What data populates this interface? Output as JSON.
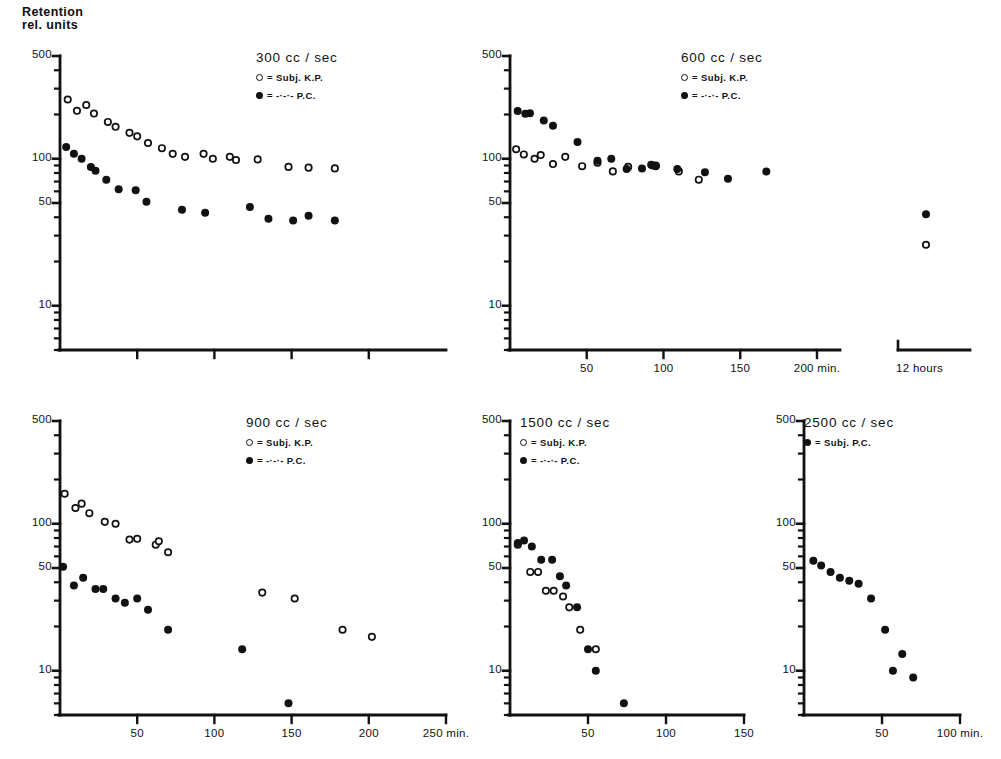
{
  "figure": {
    "y_axis_title_line1": "Retention",
    "y_axis_title_line2": "rel. units"
  },
  "chart_data": [
    {
      "id": "panel-300",
      "type": "scatter",
      "title": "300 cc / sec",
      "xlabel": "",
      "ylabel": "Retention rel. units",
      "yscale": "log",
      "ylim": [
        5,
        500
      ],
      "yticks": [
        500,
        100,
        50,
        10
      ],
      "ytick_labels": [
        "500",
        "100",
        "50",
        "10"
      ],
      "xlim": [
        0,
        250
      ],
      "xticks": [
        50,
        100,
        150,
        200
      ],
      "xtick_labels": [
        "",
        "",
        "",
        ""
      ],
      "grid": false,
      "legend_position": "top-right",
      "series": [
        {
          "name": "Subj. K.P.",
          "marker": "open-circle",
          "legend_text": "O = Subj. K.P.",
          "points": [
            [
              5,
              253
            ],
            [
              11,
              212
            ],
            [
              17,
              232
            ],
            [
              22,
              203
            ],
            [
              31,
              178
            ],
            [
              36,
              165
            ],
            [
              45,
              150
            ],
            [
              50,
              142
            ],
            [
              57,
              128
            ],
            [
              66,
              118
            ],
            [
              73,
              108
            ],
            [
              81,
              103
            ],
            [
              93,
              108
            ],
            [
              99,
              100
            ],
            [
              110,
              103
            ],
            [
              114,
              98
            ],
            [
              128,
              99
            ],
            [
              148,
              88
            ],
            [
              161,
              87
            ],
            [
              178,
              86
            ]
          ]
        },
        {
          "name": "P.C.",
          "marker": "filled-circle",
          "legend_text": "● = -·-·- P.C.",
          "points": [
            [
              4,
              120
            ],
            [
              9,
              108
            ],
            [
              14,
              100
            ],
            [
              20,
              88
            ],
            [
              23,
              83
            ],
            [
              30,
              72
            ],
            [
              38,
              62
            ],
            [
              49,
              61
            ],
            [
              56,
              51
            ],
            [
              79,
              45
            ],
            [
              94,
              43
            ],
            [
              123,
              47
            ],
            [
              135,
              39
            ],
            [
              151,
              38
            ],
            [
              161,
              41
            ],
            [
              178,
              38
            ]
          ]
        }
      ]
    },
    {
      "id": "panel-600",
      "type": "scatter",
      "title": "600 cc / sec",
      "xlabel": "min.",
      "ylabel": "",
      "yscale": "log",
      "ylim": [
        5,
        500
      ],
      "yticks": [
        500,
        100,
        50,
        10
      ],
      "ytick_labels": [
        "500",
        "100",
        "50",
        "10"
      ],
      "xlim": [
        0,
        215
      ],
      "xticks": [
        50,
        100,
        150,
        200
      ],
      "xtick_labels": [
        "50",
        "100",
        "150",
        "200 min."
      ],
      "break_axis_label": "12 hours",
      "grid": false,
      "legend_position": "top-right",
      "series": [
        {
          "name": "Subj. K.P.",
          "marker": "open-circle",
          "legend_text": "O = Subj. K.P.",
          "points": [
            [
              4,
              116
            ],
            [
              9,
              107
            ],
            [
              16,
              100
            ],
            [
              20,
              106
            ],
            [
              28,
              92
            ],
            [
              36,
              103
            ],
            [
              47,
              89
            ],
            [
              57,
              94
            ],
            [
              67,
              82
            ],
            [
              77,
              88
            ],
            [
              92,
              91
            ],
            [
              95,
              90
            ],
            [
              110,
              82
            ],
            [
              123,
              72
            ]
          ]
        },
        {
          "name": "P.C.",
          "marker": "filled-circle",
          "legend_text": "● = -·-·- P.C.",
          "points": [
            [
              5,
              211
            ],
            [
              10,
              202
            ],
            [
              13,
              204
            ],
            [
              22,
              182
            ],
            [
              28,
              168
            ],
            [
              44,
              130
            ],
            [
              57,
              97
            ],
            [
              66,
              100
            ],
            [
              76,
              85
            ],
            [
              86,
              86
            ],
            [
              93,
              90
            ],
            [
              95,
              89
            ],
            [
              109,
              85
            ],
            [
              127,
              81
            ],
            [
              142,
              73
            ],
            [
              167,
              82
            ]
          ]
        }
      ],
      "break_points": [
        {
          "series": "P.C.",
          "marker": "filled-circle",
          "value": 42
        },
        {
          "series": "Subj. K.P.",
          "marker": "open-circle",
          "value": 26
        }
      ]
    },
    {
      "id": "panel-900",
      "type": "scatter",
      "title": "900 cc / sec",
      "xlabel": "min.",
      "ylabel": "Retention rel. units",
      "yscale": "log",
      "ylim": [
        5,
        500
      ],
      "yticks": [
        500,
        100,
        50,
        10
      ],
      "ytick_labels": [
        "500",
        "100",
        "50",
        "10"
      ],
      "xlim": [
        0,
        250
      ],
      "xticks": [
        50,
        100,
        150,
        200,
        250
      ],
      "xtick_labels": [
        "50",
        "100",
        "150",
        "200",
        "250 min."
      ],
      "grid": false,
      "legend_position": "top-right",
      "series": [
        {
          "name": "Subj. K.P.",
          "marker": "open-circle",
          "legend_text": "O = Subj. K.P.",
          "points": [
            [
              3,
              160
            ],
            [
              10,
              128
            ],
            [
              14,
              137
            ],
            [
              19,
              118
            ],
            [
              29,
              103
            ],
            [
              36,
              100
            ],
            [
              45,
              78
            ],
            [
              50,
              79
            ],
            [
              62,
              72
            ],
            [
              64,
              76
            ],
            [
              70,
              64
            ],
            [
              131,
              34
            ],
            [
              152,
              31
            ],
            [
              183,
              19
            ],
            [
              202,
              17
            ]
          ]
        },
        {
          "name": "P.C.",
          "marker": "filled-circle",
          "legend_text": "● = -·-·- P.C.",
          "points": [
            [
              2,
              51
            ],
            [
              15,
              43
            ],
            [
              9,
              38
            ],
            [
              23,
              36
            ],
            [
              28,
              36
            ],
            [
              36,
              31
            ],
            [
              42,
              29
            ],
            [
              50,
              31
            ],
            [
              57,
              26
            ],
            [
              70,
              19
            ],
            [
              118,
              14
            ],
            [
              148,
              6
            ]
          ]
        }
      ]
    },
    {
      "id": "panel-1500",
      "type": "scatter",
      "title": "1500 cc / sec",
      "xlabel": "",
      "ylabel": "",
      "yscale": "log",
      "ylim": [
        5,
        500
      ],
      "yticks": [
        500,
        100,
        50,
        10
      ],
      "ytick_labels": [
        "500",
        "100",
        "50",
        "10"
      ],
      "xlim": [
        0,
        150
      ],
      "xticks": [
        50,
        100,
        150
      ],
      "xtick_labels": [
        "50",
        "100",
        "150"
      ],
      "grid": false,
      "legend_position": "top-right",
      "series": [
        {
          "name": "Subj. K.P.",
          "marker": "open-circle",
          "legend_text": "O = Subj. K.P.",
          "points": [
            [
              5,
              72
            ],
            [
              13,
              47
            ],
            [
              18,
              47
            ],
            [
              23,
              35
            ],
            [
              28,
              35
            ],
            [
              34,
              32
            ],
            [
              38,
              27
            ],
            [
              45,
              19
            ],
            [
              55,
              14
            ]
          ]
        },
        {
          "name": "P.C.",
          "marker": "filled-circle",
          "legend_text": "● = -·-·- P.C.",
          "points": [
            [
              5,
              74
            ],
            [
              9,
              77
            ],
            [
              14,
              70
            ],
            [
              20,
              57
            ],
            [
              27,
              57
            ],
            [
              32,
              44
            ],
            [
              36,
              38
            ],
            [
              43,
              27
            ],
            [
              50,
              14
            ],
            [
              55,
              10
            ],
            [
              73,
              6
            ]
          ]
        }
      ]
    },
    {
      "id": "panel-2500",
      "type": "scatter",
      "title": "2500 cc / sec",
      "xlabel": "min.",
      "ylabel": "",
      "yscale": "log",
      "ylim": [
        5,
        500
      ],
      "yticks": [
        500,
        100,
        50,
        10
      ],
      "ytick_labels": [
        "500",
        "100",
        "50",
        "10"
      ],
      "xlim": [
        0,
        100
      ],
      "xticks": [
        50,
        100
      ],
      "xtick_labels": [
        "50",
        "100 min."
      ],
      "grid": false,
      "legend_position": "top-right",
      "series": [
        {
          "name": "Subj. P.C.",
          "marker": "filled-circle",
          "legend_text": "● = Subj. P.C.",
          "points": [
            [
              6,
              56
            ],
            [
              11,
              52
            ],
            [
              17,
              47
            ],
            [
              23,
              43
            ],
            [
              29,
              41
            ],
            [
              35,
              39
            ],
            [
              43,
              31
            ],
            [
              52,
              19
            ],
            [
              63,
              13
            ],
            [
              57,
              10
            ],
            [
              70,
              9
            ]
          ]
        }
      ]
    }
  ]
}
